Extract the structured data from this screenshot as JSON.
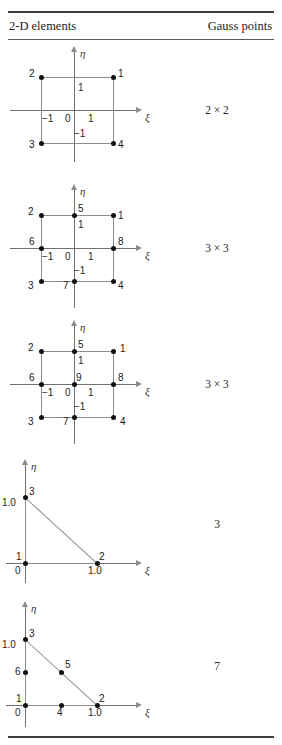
{
  "header": {
    "col_elements": "2-D elements",
    "col_gauss": "Gauss points"
  },
  "axis_labels": {
    "xi": "ξ",
    "eta": "η"
  },
  "rows": [
    {
      "id": "quad4",
      "gauss": "2 × 2",
      "ticks": {
        "xneg": "−1",
        "zero": "0",
        "xpos": "1",
        "yneg": "−1",
        "ypos": "1"
      },
      "nodes": [
        "1",
        "2",
        "3",
        "4"
      ]
    },
    {
      "id": "quad8",
      "gauss": "3 × 3",
      "ticks": {
        "xneg": "−1",
        "zero": "0",
        "xpos": "1",
        "yneg": "−1",
        "ypos": "1"
      },
      "nodes": [
        "1",
        "2",
        "3",
        "4",
        "5",
        "6",
        "7",
        "8"
      ]
    },
    {
      "id": "quad9",
      "gauss": "3 × 3",
      "ticks": {
        "xneg": "−1",
        "zero": "0",
        "xpos": "1",
        "yneg": "−1",
        "ypos": "1"
      },
      "nodes": [
        "1",
        "2",
        "3",
        "4",
        "5",
        "6",
        "7",
        "8",
        "9"
      ]
    },
    {
      "id": "tri3",
      "gauss": "3",
      "ticks": {
        "zero": "0",
        "xone": "1.0",
        "yone": "1.0"
      },
      "nodes": [
        "1",
        "2",
        "3"
      ]
    },
    {
      "id": "tri6",
      "gauss": "7",
      "ticks": {
        "zero": "0",
        "xone": "1.0",
        "yone": "1.0"
      },
      "nodes": [
        "1",
        "2",
        "3",
        "4",
        "5",
        "6"
      ]
    }
  ]
}
